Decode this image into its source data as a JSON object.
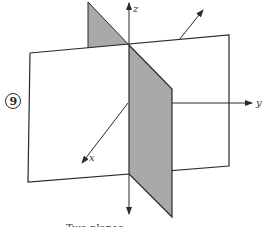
{
  "figure": {
    "number": "9",
    "caption": "Two planes",
    "axes": {
      "x": "x",
      "y": "y",
      "z": "z"
    },
    "colors": {
      "shaded_plane": "#a9a9a9",
      "line": "#2a2a2a",
      "white_plane": "#ffffff"
    }
  }
}
